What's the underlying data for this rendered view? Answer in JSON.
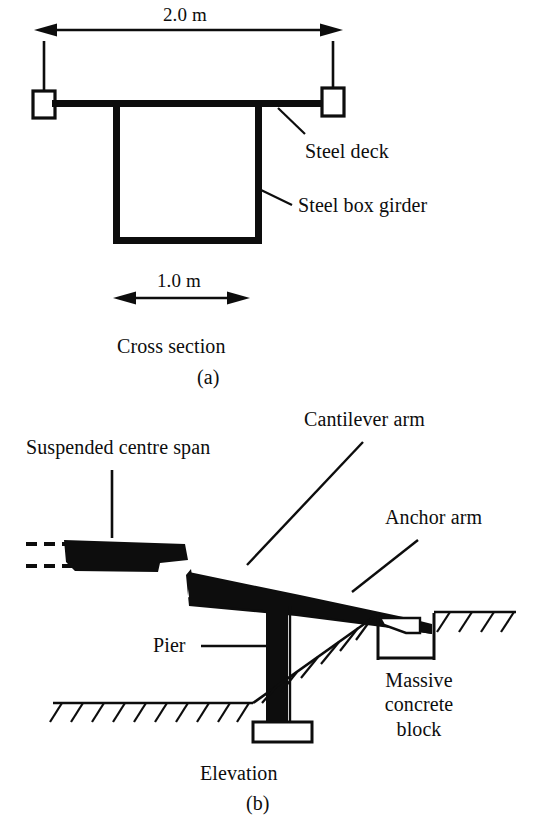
{
  "figure": {
    "ink_color": "#0d0d0d",
    "background_color": "#ffffff"
  },
  "cross_section": {
    "panel_letter": "(a)",
    "caption": "Cross section",
    "deck_width_dimension": "2.0 m",
    "girder_width_dimension": "1.0 m",
    "callouts": [
      {
        "label": "Steel deck"
      },
      {
        "label": "Steel box girder"
      }
    ]
  },
  "elevation": {
    "panel_letter": "(b)",
    "caption": "Elevation",
    "callouts": [
      {
        "label": "Suspended centre span"
      },
      {
        "label": "Cantilever arm"
      },
      {
        "label": "Anchor arm"
      },
      {
        "label": "Pier"
      },
      {
        "label": "Massive concrete block",
        "line1": "Massive",
        "line2": "concrete",
        "line3": "block"
      }
    ]
  }
}
